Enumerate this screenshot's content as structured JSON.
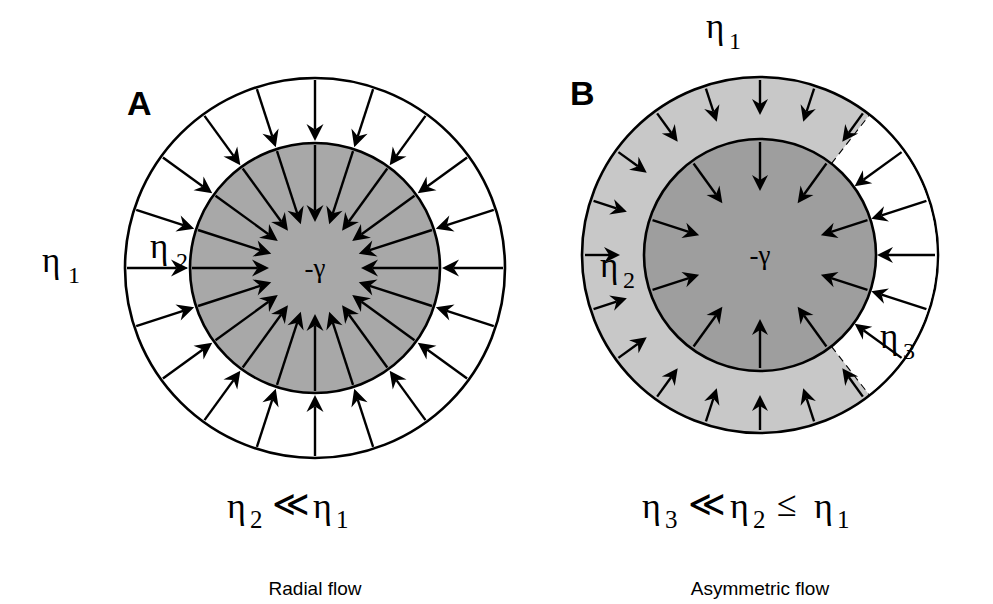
{
  "figure": {
    "width": 993,
    "height": 604,
    "background": "#ffffff",
    "stroke_color": "#000000"
  },
  "colors": {
    "outline": "#000000",
    "white_region": "#ffffff",
    "mid_gray_core": "#a8a8a8",
    "light_gray_ring": "#c8c8c8",
    "dark_gray_core_b": "#9e9e9e",
    "text": "#000000"
  },
  "panels": [
    {
      "id": "A",
      "letter": "A",
      "letter_pos": {
        "x": 127,
        "y": 115
      },
      "center": {
        "x": 315,
        "y": 268
      },
      "outer_radius": 190,
      "inner_radius": 125,
      "outer_fill": "#ffffff",
      "inner_fill": "#a8a8a8",
      "arrow_count": 20,
      "arrow_start_angle_deg": -90,
      "center_label": {
        "text": "-γ",
        "x": 315,
        "y": 277
      },
      "region_labels": [
        {
          "name": "eta1",
          "base": "η",
          "sub": "1",
          "x": 42,
          "y": 272,
          "sub_x": 68,
          "sub_y": 283
        },
        {
          "name": "eta2",
          "base": "η",
          "sub": "2",
          "x": 150,
          "y": 258,
          "sub_x": 176,
          "sub_y": 269
        }
      ],
      "relation": {
        "parts": [
          {
            "type": "base",
            "text": "η",
            "x": 227,
            "y": 518
          },
          {
            "type": "sub",
            "text": "2",
            "x": 250,
            "y": 528
          },
          {
            "type": "base",
            "text": "≪",
            "x": 272,
            "y": 516
          },
          {
            "type": "base",
            "text": "η",
            "x": 313,
            "y": 518
          },
          {
            "type": "sub",
            "text": "1",
            "x": 336,
            "y": 528
          }
        ]
      },
      "caption": {
        "text": "Radial flow",
        "x": 315,
        "y": 595
      }
    },
    {
      "id": "B",
      "letter": "B",
      "letter_pos": {
        "x": 570,
        "y": 105
      },
      "center": {
        "x": 760,
        "y": 255
      },
      "outer_radius": 178,
      "inner_radius": 116,
      "ring_fill": "#c8c8c8",
      "inner_fill": "#9e9e9e",
      "wedge_fill": "#ffffff",
      "wedge_start_deg": -52,
      "wedge_end_deg": 52,
      "arrow_count": 20,
      "arrow_start_angle_deg": -90,
      "center_label": {
        "text": "-γ",
        "x": 760,
        "y": 264
      },
      "region_labels": [
        {
          "name": "eta1",
          "base": "η",
          "sub": "1",
          "x": 706,
          "y": 38,
          "sub_x": 729,
          "sub_y": 49
        },
        {
          "name": "eta2",
          "base": "η",
          "sub": "2",
          "x": 600,
          "y": 277,
          "sub_x": 623,
          "sub_y": 288
        },
        {
          "name": "eta3",
          "base": "η",
          "sub": "3",
          "x": 880,
          "y": 348,
          "sub_x": 903,
          "sub_y": 359
        }
      ],
      "relation": {
        "parts": [
          {
            "type": "base",
            "text": "η",
            "x": 642,
            "y": 518
          },
          {
            "type": "sub",
            "text": "3",
            "x": 665,
            "y": 528
          },
          {
            "type": "base",
            "text": "≪",
            "x": 688,
            "y": 516
          },
          {
            "type": "base",
            "text": "η",
            "x": 730,
            "y": 518
          },
          {
            "type": "sub",
            "text": "2",
            "x": 753,
            "y": 528
          },
          {
            "type": "base",
            "text": "≤",
            "x": 777,
            "y": 516
          },
          {
            "type": "base",
            "text": "η",
            "x": 814,
            "y": 518
          },
          {
            "type": "sub",
            "text": "1",
            "x": 837,
            "y": 528
          }
        ]
      },
      "caption": {
        "text": "Asymmetric flow",
        "x": 760,
        "y": 595
      }
    }
  ],
  "diagram_meaning": {
    "symbol_eta": "η",
    "symbol_gamma": "-γ",
    "symbol_much_less": "≪",
    "symbol_less_equal": "≤"
  }
}
